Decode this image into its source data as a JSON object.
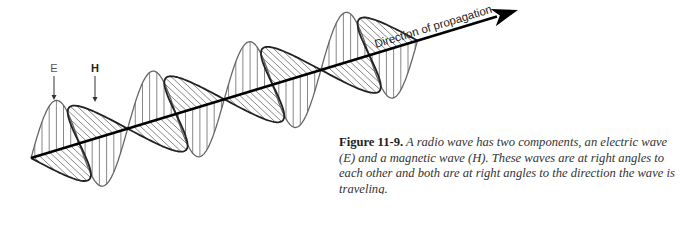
{
  "figure": {
    "number_label": "Figure 11-9.",
    "caption": " A radio wave has two components, an electric wave (E) and a magnetic wave (H). These waves are at right angles to each other and both are at right angles to the direction the wave is traveling."
  },
  "labels": {
    "electric": "E",
    "magnetic": "H",
    "axis": "Direction of propagation"
  },
  "colors": {
    "axis": "#000000",
    "e_wave": "#666666",
    "h_wave": "#222222",
    "hatch": "#555555",
    "background": "#ffffff"
  },
  "geometry": {
    "axis_start": [
      31,
      158
    ],
    "axis_end": [
      518,
      10
    ],
    "wave_length_along_axis": 404,
    "half_wavelength": 50.5,
    "e_amplitude": 50,
    "h_displacement": [
      32,
      30
    ],
    "e_label_pos": [
      54,
      72
    ],
    "h_label_pos": [
      95,
      72
    ]
  }
}
